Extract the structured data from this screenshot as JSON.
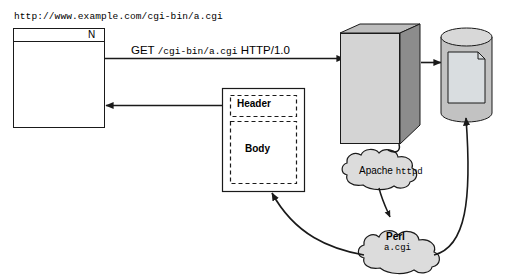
{
  "diagram": {
    "colors": {
      "stroke": "#1a1a1a",
      "server_front": "#d4d4d4",
      "server_side": "#8c8c8c",
      "server_top": "#bdbdbd",
      "cylinder_body": "#c2c2c2",
      "cylinder_top": "#d8d8d8",
      "file_fill": "#d9dde0",
      "cloud_fill": "#dcdcdc",
      "background": "#ffffff"
    }
  },
  "browser": {
    "url": "http://www.example.com/cgi-bin/a.cgi",
    "logo": "N",
    "name": "web-browser-window"
  },
  "request": {
    "method": "GET",
    "path": "/cgi-bin/a.cgi",
    "protocol": "HTTP/1.0"
  },
  "response": {
    "header_label": "Header",
    "body_label": "Body"
  },
  "server": {
    "name": "web-server-machine"
  },
  "database": {
    "name": "data-store-cylinder",
    "contains": "file-document"
  },
  "apache": {
    "program": "Apache",
    "daemon": "httpd"
  },
  "perl": {
    "interpreter": "Perl",
    "script": "a.cgi"
  }
}
